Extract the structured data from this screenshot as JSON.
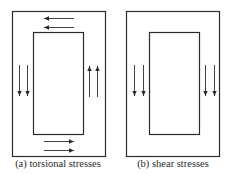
{
  "figures": [
    {
      "id": "a",
      "caption": "(a) torsional stresses",
      "arrows": {
        "top": "left",
        "bottom": "right",
        "left": "down",
        "right": "up"
      }
    },
    {
      "id": "b",
      "caption": "(b) shear stresses",
      "arrows": {
        "left": "down",
        "right": "down"
      }
    }
  ],
  "colors": {
    "stroke": "#2b2b2b",
    "background": "#ffffff"
  }
}
